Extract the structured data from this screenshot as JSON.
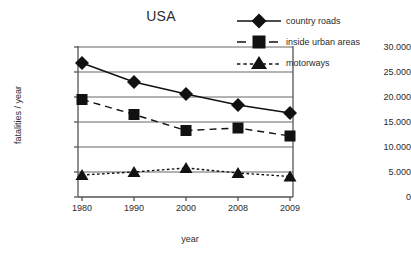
{
  "chart_data": {
    "type": "line",
    "title": "USA",
    "xlabel": "year",
    "ylabel": "fatalities / year",
    "categories": [
      "1980",
      "1990",
      "2000",
      "2008",
      "2009"
    ],
    "x": [
      1980,
      1990,
      2000,
      2008,
      2009
    ],
    "ylim": [
      0,
      30000
    ],
    "yticks": [
      0,
      5000,
      10000,
      15000,
      20000,
      25000,
      30000
    ],
    "ytick_labels": [
      "0",
      "5.000",
      "10.000",
      "15.000",
      "20.000",
      "25.000",
      "30.000"
    ],
    "grid": "horizontal",
    "legend_position": "top-right",
    "series": [
      {
        "name": "country roads",
        "marker": "diamond",
        "line_style": "solid",
        "color": "#111111",
        "values": [
          26800,
          23000,
          20600,
          18400,
          16800
        ]
      },
      {
        "name": "inside urban areas",
        "marker": "square",
        "line_style": "dashed",
        "color": "#111111",
        "values": [
          19500,
          16500,
          13300,
          13800,
          12200
        ]
      },
      {
        "name": "motorways",
        "marker": "triangle",
        "line_style": "dotted",
        "color": "#111111",
        "values": [
          4400,
          5000,
          5800,
          4800,
          4100
        ]
      }
    ]
  },
  "legend": {
    "items": [
      {
        "label": "country roads"
      },
      {
        "label": "inside urban areas"
      },
      {
        "label": "motorways"
      }
    ]
  },
  "axis": {
    "y_label": "fatalities / year",
    "x_label": "year",
    "y_tick_labels": [
      "30.000",
      "25.000",
      "20.000",
      "15.000",
      "10.000",
      "5.000",
      "0"
    ],
    "x_tick_labels": [
      "1980",
      "1990",
      "2000",
      "2008",
      "2009"
    ]
  },
  "colors": {
    "ink": "#111111",
    "axis": "#555555",
    "grid": "#666666",
    "background": "#ffffff"
  }
}
